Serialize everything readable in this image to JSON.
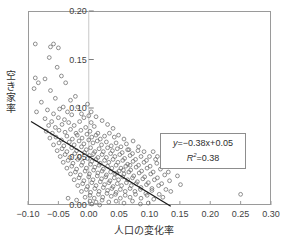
{
  "chart_data": {
    "type": "scatter",
    "title": "",
    "xlabel": "人口の変化率",
    "ylabel": "空き家率",
    "xlim": [
      -0.1,
      0.3
    ],
    "ylim": [
      0.0,
      0.2
    ],
    "xticks": [
      "-0.10",
      "-0.05",
      "0.00",
      "0.05",
      "0.10",
      "0.15",
      "0.20",
      "0.25",
      "0.30"
    ],
    "xtick_values": [
      -0.1,
      -0.05,
      0.0,
      0.05,
      0.1,
      0.15,
      0.2,
      0.25,
      0.3
    ],
    "yticks": [
      "0.00",
      "0.05",
      "0.10",
      "0.15",
      "0.20"
    ],
    "ytick_values": [
      0.0,
      0.05,
      0.1,
      0.15,
      0.2
    ],
    "grid": false,
    "legend": "none",
    "marker": "open-circle",
    "marker_color": "#6b6b6b",
    "frame_color": "#9a9a9a",
    "axis_line_color": "#c8c8c8",
    "trendline": {
      "slope": -0.38,
      "intercept": 0.05,
      "r_squared": 0.38,
      "color": "#1a1a1a",
      "x_start": -0.095,
      "x_end": 0.135
    },
    "annotation": {
      "equation_y": "y",
      "equation_rest": "=−0.38x+0.05",
      "equation_full": "y=−0.38x+0.05",
      "r2_label": "R",
      "r2_sup": "2",
      "r2_value": "=0.38",
      "r2_full": "R2=0.38"
    },
    "points": [
      [
        -0.088,
        0.166
      ],
      [
        -0.063,
        0.163
      ],
      [
        -0.058,
        0.166
      ],
      [
        -0.05,
        0.162
      ],
      [
        -0.065,
        0.152
      ],
      [
        -0.052,
        0.142
      ],
      [
        -0.088,
        0.131
      ],
      [
        -0.083,
        0.126
      ],
      [
        -0.072,
        0.13
      ],
      [
        -0.045,
        0.133
      ],
      [
        -0.09,
        0.12
      ],
      [
        -0.063,
        0.118
      ],
      [
        -0.038,
        0.126
      ],
      [
        -0.055,
        0.11
      ],
      [
        -0.078,
        0.106
      ],
      [
        -0.03,
        0.108
      ],
      [
        -0.042,
        0.101
      ],
      [
        -0.068,
        0.098
      ],
      [
        -0.086,
        0.096
      ],
      [
        -0.058,
        0.094
      ],
      [
        -0.048,
        0.099
      ],
      [
        -0.022,
        0.112
      ],
      [
        -0.035,
        0.096
      ],
      [
        -0.072,
        0.089
      ],
      [
        -0.061,
        0.086
      ],
      [
        -0.05,
        0.09
      ],
      [
        -0.04,
        0.088
      ],
      [
        -0.028,
        0.093
      ],
      [
        -0.018,
        0.101
      ],
      [
        -0.012,
        0.094
      ],
      [
        -0.066,
        0.082
      ],
      [
        -0.055,
        0.08
      ],
      [
        -0.044,
        0.083
      ],
      [
        -0.033,
        0.085
      ],
      [
        -0.024,
        0.082
      ],
      [
        -0.015,
        0.086
      ],
      [
        -0.008,
        0.09
      ],
      [
        0.0,
        0.092
      ],
      [
        0.004,
        0.085
      ],
      [
        -0.07,
        0.076
      ],
      [
        -0.06,
        0.074
      ],
      [
        -0.049,
        0.077
      ],
      [
        -0.039,
        0.075
      ],
      [
        -0.03,
        0.078
      ],
      [
        -0.021,
        0.074
      ],
      [
        -0.013,
        0.077
      ],
      [
        -0.005,
        0.08
      ],
      [
        0.002,
        0.076
      ],
      [
        0.009,
        0.081
      ],
      [
        0.015,
        0.074
      ],
      [
        -0.064,
        0.069
      ],
      [
        -0.054,
        0.07
      ],
      [
        -0.045,
        0.067
      ],
      [
        -0.036,
        0.071
      ],
      [
        -0.027,
        0.068
      ],
      [
        -0.019,
        0.072
      ],
      [
        -0.011,
        0.069
      ],
      [
        -0.003,
        0.073
      ],
      [
        0.005,
        0.07
      ],
      [
        0.012,
        0.072
      ],
      [
        0.019,
        0.068
      ],
      [
        0.026,
        0.071
      ],
      [
        0.034,
        0.074
      ],
      [
        0.042,
        0.07
      ],
      [
        -0.058,
        0.062
      ],
      [
        -0.049,
        0.064
      ],
      [
        -0.041,
        0.061
      ],
      [
        -0.032,
        0.065
      ],
      [
        -0.024,
        0.062
      ],
      [
        -0.016,
        0.066
      ],
      [
        -0.008,
        0.063
      ],
      [
        0.0,
        0.067
      ],
      [
        0.007,
        0.064
      ],
      [
        0.014,
        0.066
      ],
      [
        0.021,
        0.062
      ],
      [
        0.029,
        0.065
      ],
      [
        0.037,
        0.061
      ],
      [
        0.045,
        0.064
      ],
      [
        0.053,
        0.06
      ],
      [
        0.062,
        0.063
      ],
      [
        -0.052,
        0.056
      ],
      [
        -0.044,
        0.058
      ],
      [
        -0.036,
        0.055
      ],
      [
        -0.028,
        0.059
      ],
      [
        -0.02,
        0.056
      ],
      [
        -0.012,
        0.06
      ],
      [
        -0.004,
        0.057
      ],
      [
        0.003,
        0.059
      ],
      [
        0.01,
        0.055
      ],
      [
        0.017,
        0.058
      ],
      [
        0.024,
        0.055
      ],
      [
        0.031,
        0.059
      ],
      [
        0.039,
        0.056
      ],
      [
        0.047,
        0.058
      ],
      [
        0.055,
        0.054
      ],
      [
        0.064,
        0.057
      ],
      [
        0.072,
        0.053
      ],
      [
        0.081,
        0.056
      ],
      [
        -0.047,
        0.05
      ],
      [
        -0.039,
        0.052
      ],
      [
        -0.031,
        0.049
      ],
      [
        -0.023,
        0.053
      ],
      [
        -0.015,
        0.05
      ],
      [
        -0.007,
        0.054
      ],
      [
        0.001,
        0.051
      ],
      [
        0.008,
        0.053
      ],
      [
        0.015,
        0.049
      ],
      [
        0.022,
        0.052
      ],
      [
        0.029,
        0.049
      ],
      [
        0.036,
        0.053
      ],
      [
        0.043,
        0.05
      ],
      [
        0.051,
        0.052
      ],
      [
        0.059,
        0.048
      ],
      [
        0.068,
        0.051
      ],
      [
        0.077,
        0.047
      ],
      [
        0.086,
        0.05
      ],
      [
        0.095,
        0.046
      ],
      [
        -0.042,
        0.044
      ],
      [
        -0.034,
        0.046
      ],
      [
        -0.026,
        0.043
      ],
      [
        -0.018,
        0.047
      ],
      [
        -0.01,
        0.044
      ],
      [
        -0.002,
        0.048
      ],
      [
        0.005,
        0.045
      ],
      [
        0.012,
        0.047
      ],
      [
        0.019,
        0.043
      ],
      [
        0.026,
        0.046
      ],
      [
        0.033,
        0.044
      ],
      [
        0.04,
        0.047
      ],
      [
        0.048,
        0.044
      ],
      [
        0.056,
        0.046
      ],
      [
        0.064,
        0.042
      ],
      [
        0.073,
        0.045
      ],
      [
        0.082,
        0.041
      ],
      [
        0.091,
        0.044
      ],
      [
        0.101,
        0.04
      ],
      [
        0.112,
        0.043
      ],
      [
        -0.036,
        0.038
      ],
      [
        -0.028,
        0.04
      ],
      [
        -0.02,
        0.037
      ],
      [
        -0.012,
        0.041
      ],
      [
        -0.004,
        0.038
      ],
      [
        0.003,
        0.042
      ],
      [
        0.01,
        0.039
      ],
      [
        0.017,
        0.041
      ],
      [
        0.024,
        0.037
      ],
      [
        0.031,
        0.04
      ],
      [
        0.038,
        0.038
      ],
      [
        0.045,
        0.041
      ],
      [
        0.053,
        0.038
      ],
      [
        0.061,
        0.04
      ],
      [
        0.069,
        0.036
      ],
      [
        0.078,
        0.039
      ],
      [
        0.087,
        0.035
      ],
      [
        0.096,
        0.038
      ],
      [
        0.106,
        0.034
      ],
      [
        0.118,
        0.037
      ],
      [
        -0.03,
        0.032
      ],
      [
        -0.022,
        0.034
      ],
      [
        -0.014,
        0.031
      ],
      [
        -0.006,
        0.035
      ],
      [
        0.001,
        0.032
      ],
      [
        0.008,
        0.036
      ],
      [
        0.015,
        0.033
      ],
      [
        0.022,
        0.035
      ],
      [
        0.029,
        0.031
      ],
      [
        0.036,
        0.034
      ],
      [
        0.043,
        0.032
      ],
      [
        0.05,
        0.035
      ],
      [
        0.058,
        0.032
      ],
      [
        0.066,
        0.034
      ],
      [
        0.074,
        0.03
      ],
      [
        0.083,
        0.033
      ],
      [
        0.092,
        0.029
      ],
      [
        0.102,
        0.032
      ],
      [
        0.113,
        0.028
      ],
      [
        0.125,
        0.031
      ],
      [
        -0.024,
        0.026
      ],
      [
        -0.016,
        0.028
      ],
      [
        -0.008,
        0.025
      ],
      [
        0.0,
        0.029
      ],
      [
        0.007,
        0.026
      ],
      [
        0.014,
        0.03
      ],
      [
        0.021,
        0.027
      ],
      [
        0.028,
        0.029
      ],
      [
        0.035,
        0.025
      ],
      [
        0.042,
        0.028
      ],
      [
        0.049,
        0.026
      ],
      [
        0.056,
        0.029
      ],
      [
        0.064,
        0.026
      ],
      [
        0.072,
        0.028
      ],
      [
        0.08,
        0.024
      ],
      [
        0.089,
        0.027
      ],
      [
        0.098,
        0.023
      ],
      [
        0.108,
        0.026
      ],
      [
        0.12,
        0.022
      ],
      [
        0.133,
        0.025
      ],
      [
        -0.018,
        0.02
      ],
      [
        -0.01,
        0.022
      ],
      [
        -0.002,
        0.019
      ],
      [
        0.005,
        0.023
      ],
      [
        0.012,
        0.02
      ],
      [
        0.019,
        0.024
      ],
      [
        0.026,
        0.021
      ],
      [
        0.033,
        0.023
      ],
      [
        0.04,
        0.019
      ],
      [
        0.047,
        0.022
      ],
      [
        0.054,
        0.02
      ],
      [
        0.062,
        0.023
      ],
      [
        0.07,
        0.02
      ],
      [
        0.078,
        0.022
      ],
      [
        0.086,
        0.018
      ],
      [
        0.095,
        0.021
      ],
      [
        0.104,
        0.017
      ],
      [
        0.115,
        0.02
      ],
      [
        0.127,
        0.016
      ],
      [
        -0.012,
        0.014
      ],
      [
        -0.004,
        0.016
      ],
      [
        0.003,
        0.013
      ],
      [
        0.01,
        0.017
      ],
      [
        0.017,
        0.014
      ],
      [
        0.024,
        0.018
      ],
      [
        0.031,
        0.015
      ],
      [
        0.038,
        0.017
      ],
      [
        0.045,
        0.013
      ],
      [
        0.052,
        0.016
      ],
      [
        0.06,
        0.014
      ],
      [
        0.068,
        0.017
      ],
      [
        0.076,
        0.014
      ],
      [
        0.085,
        0.016
      ],
      [
        0.094,
        0.012
      ],
      [
        0.104,
        0.015
      ],
      [
        0.116,
        0.011
      ],
      [
        -0.006,
        0.008
      ],
      [
        0.002,
        0.01
      ],
      [
        0.009,
        0.007
      ],
      [
        0.016,
        0.011
      ],
      [
        0.023,
        0.008
      ],
      [
        0.03,
        0.012
      ],
      [
        0.037,
        0.009
      ],
      [
        0.044,
        0.011
      ],
      [
        0.052,
        0.007
      ],
      [
        0.06,
        0.01
      ],
      [
        0.068,
        0.008
      ],
      [
        0.077,
        0.011
      ],
      [
        0.086,
        0.007
      ],
      [
        0.096,
        0.01
      ],
      [
        0.107,
        0.006
      ],
      [
        0.002,
        0.004
      ],
      [
        0.012,
        0.003
      ],
      [
        0.022,
        0.005
      ],
      [
        0.033,
        0.003
      ],
      [
        0.045,
        0.004
      ],
      [
        0.058,
        0.002
      ],
      [
        0.072,
        0.004
      ],
      [
        0.25,
        0.011
      ],
      [
        -0.034,
        0.007
      ],
      [
        -0.02,
        0.005
      ],
      [
        0.005,
        0.001
      ],
      [
        0.018,
        0.0
      ],
      [
        0.146,
        0.03
      ],
      [
        0.151,
        0.021
      ],
      [
        0.135,
        0.014
      ],
      [
        0.122,
        0.008
      ],
      [
        0.098,
        0.002
      ],
      [
        0.085,
        0.001
      ],
      [
        0.066,
        0.057
      ],
      [
        0.058,
        0.068
      ],
      [
        0.049,
        0.072
      ],
      [
        0.04,
        0.079
      ],
      [
        0.031,
        0.083
      ],
      [
        0.073,
        0.066
      ],
      [
        0.082,
        0.06
      ],
      [
        0.091,
        0.055
      ],
      [
        0.1,
        0.05
      ],
      [
        0.11,
        0.047
      ],
      [
        0.122,
        0.042
      ],
      [
        0.131,
        0.034
      ],
      [
        0.141,
        0.04
      ],
      [
        0.012,
        0.091
      ],
      [
        0.004,
        0.096
      ],
      [
        -0.002,
        0.104
      ],
      [
        0.022,
        0.087
      ],
      [
        0.106,
        0.055
      ],
      [
        0.113,
        0.05
      ],
      [
        0.068,
        0.041
      ],
      [
        0.057,
        0.036
      ],
      [
        0.046,
        0.033
      ]
    ]
  }
}
